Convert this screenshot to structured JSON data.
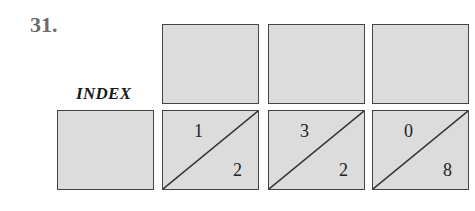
{
  "problem_number": "31.",
  "label": "INDEX",
  "top_row": [
    {
      "id": "top-1",
      "empty": true
    },
    {
      "id": "top-2",
      "empty": true
    },
    {
      "id": "top-3",
      "empty": true
    }
  ],
  "bottom_row": [
    {
      "id": "index-box",
      "empty": true
    },
    {
      "id": "split-1",
      "top_left": "1",
      "bottom_right": "2"
    },
    {
      "id": "split-2",
      "top_left": "3",
      "bottom_right": "2"
    },
    {
      "id": "split-3",
      "top_left": "0",
      "bottom_right": "8"
    }
  ],
  "colors": {
    "box_fill": "#dcdcdc",
    "border": "#444444",
    "number": "#6b6b6b"
  }
}
